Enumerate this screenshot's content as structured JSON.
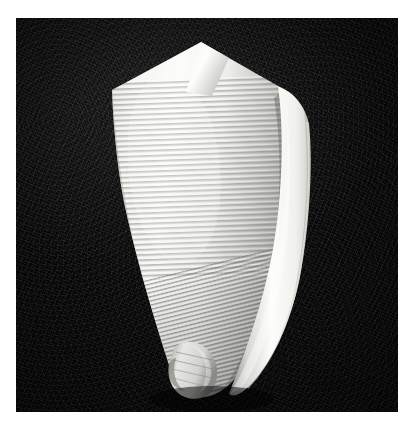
{
  "image": {
    "kind": "photograph",
    "medium": "black-and-white halftone photographic plate",
    "subject": "cone snail shell (Conus) specimen, dorsal view",
    "orientation": "apex up, anterior base down",
    "alt_text": "Black and white photograph of a conical marine gastropod shell with closely spaced spiral ribs, pointed spire at top and narrow tapering base, lit from the left against a dark speckled background."
  },
  "page": {
    "background_color": "#ffffff",
    "margin": {
      "left_px": 16,
      "top_px": 18,
      "right_px": 16,
      "bottom_px": 15
    }
  },
  "plate": {
    "left_px": 16,
    "top_px": 18,
    "width_px": 382,
    "height_px": 394,
    "background_color": "#0b0b0b",
    "background_texture": "fine photographic grain speckle",
    "highlight_zone": "upper-left quadrant slightly lighter"
  },
  "specimen": {
    "name": "cone-shell",
    "silhouette_color_light": "#fbfbfa",
    "silhouette_color_mid": "#c9c9c6",
    "silhouette_color_shadow": "#6e6e6c",
    "apex": {
      "x_px": 185,
      "y_px": 24
    },
    "base_tip": {
      "x_px": 175,
      "y_px": 378
    },
    "shoulder_left": {
      "x_px": 96,
      "y_px": 72
    },
    "shoulder_right": {
      "x_px": 262,
      "y_px": 68
    },
    "widest_width_px": 192,
    "features": [
      {
        "name": "spire-apex",
        "description": "sharp pointed spire at top center"
      },
      {
        "name": "shoulder",
        "description": "angular shoulder carina forming the widest part"
      },
      {
        "name": "spiral-ribs",
        "description": "closely spaced spiral cords across the body whorl"
      },
      {
        "name": "outer-lip",
        "description": "smooth bright aperture lip down the right margin"
      },
      {
        "name": "anterior-canal",
        "description": "narrow tapering base tip at bottom"
      }
    ],
    "rib_count": 44,
    "lighting": "strong key light from upper left, shadow along lower right"
  }
}
